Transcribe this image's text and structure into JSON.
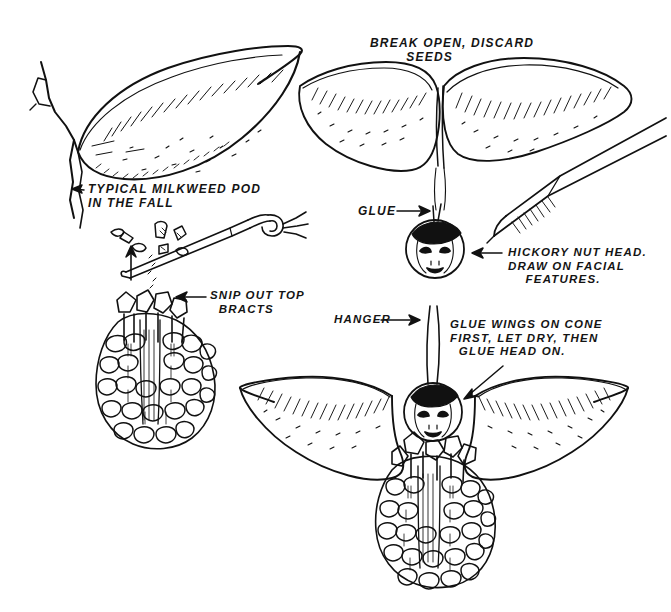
{
  "illustration": {
    "title": "Milkweed pod and pine cone angel craft instructions",
    "medium": "pen-and-ink line drawing",
    "background_color": "#ffffff",
    "ink_color": "#111111",
    "canvas": {
      "width": 671,
      "height": 612
    }
  },
  "labels": {
    "typical_pod": "TYPICAL MILKWEED POD\nIN THE FALL",
    "break_open": "BREAK OPEN, DISCARD\n        SEEDS",
    "glue": "GLUE",
    "hickory": "HICKORY NUT HEAD.\nDRAW ON FACIAL\n    FEATURES.",
    "snip": "SNIP OUT TOP\n  BRACTS",
    "hanger": "HANGER",
    "glue_wings": "GLUE WINGS ON CONE\nFIRST, LET DRY, THEN\n  GLUE HEAD ON."
  },
  "figures": {
    "pod_whole": "milkweed pod with stem, top-left",
    "pod_split": "pod broken into two wing halves, top-right",
    "nut_head": "hickory nut head with drawn face and pen",
    "cone_snip": "pine cone with scissors snipping top bracts",
    "assembled": "finished cone angel with wings, head and hanger"
  },
  "icons": {
    "arrow": "arrow-icon",
    "leader": "leader-line-icon"
  }
}
